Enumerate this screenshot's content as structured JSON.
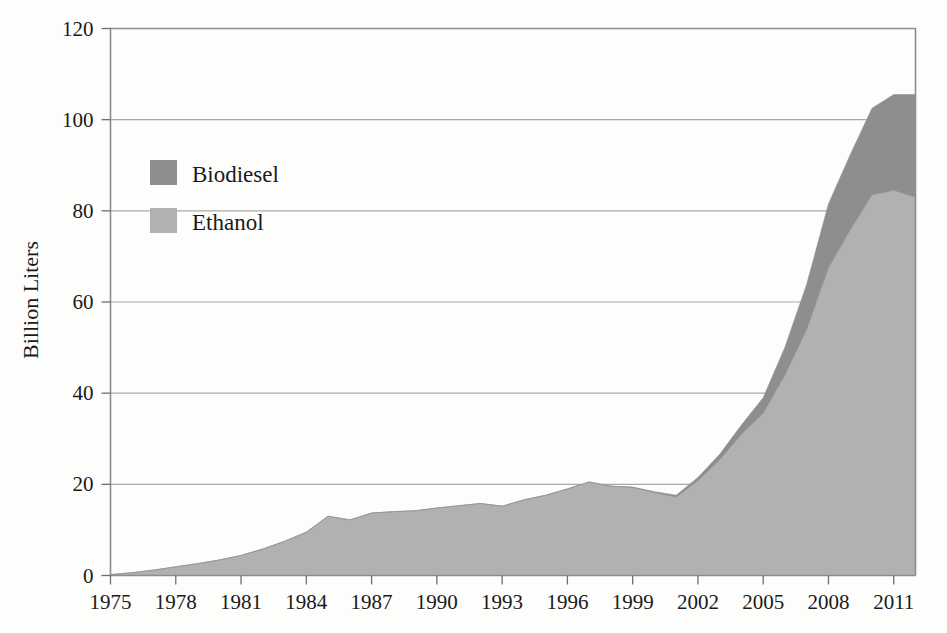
{
  "chart_data": {
    "type": "area",
    "stacked": true,
    "title": "",
    "subtitle": "",
    "xlabel": "",
    "ylabel": "Billion Liters",
    "ylim": [
      0,
      120
    ],
    "xlim": [
      1975,
      2012
    ],
    "yticks": [
      0,
      20,
      40,
      60,
      80,
      100,
      120
    ],
    "xticks": [
      1975,
      1978,
      1981,
      1984,
      1987,
      1990,
      1993,
      1996,
      1999,
      2002,
      2005,
      2008,
      2011
    ],
    "ytick_labels": [
      "0",
      "20",
      "40",
      "60",
      "80",
      "100",
      "120"
    ],
    "xtick_labels": [
      "1975",
      "1978",
      "1981",
      "1984",
      "1987",
      "1990",
      "1993",
      "1996",
      "1999",
      "2002",
      "2005",
      "2008",
      "2011"
    ],
    "grid": true,
    "grid_axis": "y",
    "legend_position": "inside-upper-left",
    "x": [
      1975,
      1976,
      1977,
      1978,
      1979,
      1980,
      1981,
      1982,
      1983,
      1984,
      1985,
      1986,
      1987,
      1988,
      1989,
      1990,
      1991,
      1992,
      1993,
      1994,
      1995,
      1996,
      1997,
      1998,
      1999,
      2000,
      2001,
      2002,
      2003,
      2004,
      2005,
      2006,
      2007,
      2008,
      2009,
      2010,
      2011,
      2012
    ],
    "series": [
      {
        "name": "Ethanol",
        "color": "#b1b1b1",
        "values": [
          0.2,
          0.6,
          1.2,
          1.9,
          2.6,
          3.4,
          4.4,
          5.8,
          7.5,
          9.5,
          13.0,
          12.2,
          13.7,
          14.0,
          14.2,
          14.8,
          15.3,
          15.8,
          15.2,
          16.6,
          17.6,
          19.0,
          20.5,
          19.6,
          19.3,
          18.2,
          17.2,
          20.8,
          25.4,
          31.0,
          35.6,
          44.0,
          54.0,
          67.5,
          75.8,
          83.5,
          84.5,
          83.0
        ]
      },
      {
        "name": "Biodiesel",
        "color": "#8e8e8e",
        "values": [
          0,
          0,
          0,
          0,
          0,
          0,
          0,
          0,
          0,
          0,
          0,
          0,
          0,
          0,
          0,
          0,
          0,
          0,
          0,
          0,
          0,
          0,
          0,
          0,
          0.1,
          0.2,
          0.4,
          0.7,
          1.2,
          2.0,
          3.4,
          6.1,
          9.9,
          14.0,
          16.5,
          19.0,
          21.0,
          22.5
        ]
      }
    ],
    "totals": [
      0.2,
      0.6,
      1.2,
      1.9,
      2.6,
      3.4,
      4.4,
      5.8,
      7.5,
      9.5,
      13.0,
      12.2,
      13.7,
      14.0,
      14.2,
      14.8,
      15.3,
      15.8,
      15.2,
      16.6,
      17.6,
      19.0,
      20.5,
      19.6,
      19.3,
      18.4,
      17.6,
      21.5,
      26.6,
      33.0,
      39.0,
      50.1,
      63.9,
      81.5,
      92.3,
      102.5,
      105.5,
      105.5
    ],
    "annotations": []
  },
  "legend": {
    "entries": [
      {
        "label": "Biodiesel",
        "color": "#8e8e8e"
      },
      {
        "label": "Ethanol",
        "color": "#b1b1b1"
      }
    ]
  },
  "axes": {
    "y_title": "Billion Liters"
  },
  "colors": {
    "background": "#fdfdfc",
    "gridline": "#a9a9a9",
    "axis": "#8d8d8d",
    "text": "#1a1a1a",
    "ethanol": "#b1b1b1",
    "biodiesel": "#8e8e8e"
  }
}
